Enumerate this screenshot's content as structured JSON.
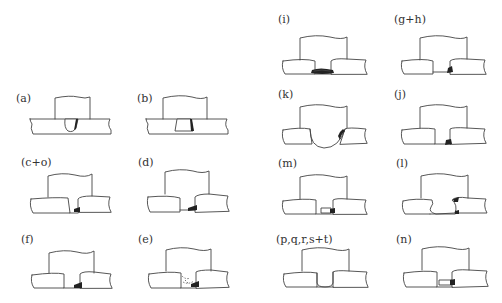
{
  "figure": {
    "panels": [
      {
        "id": "a",
        "label": "(a)"
      },
      {
        "id": "b",
        "label": "(b)"
      },
      {
        "id": "c_o",
        "label": "(c+o)"
      },
      {
        "id": "d",
        "label": "(d)"
      },
      {
        "id": "f",
        "label": "(f)"
      },
      {
        "id": "e",
        "label": "(e)"
      },
      {
        "id": "i",
        "label": "(i)"
      },
      {
        "id": "g_h",
        "label": "(g+h)"
      },
      {
        "id": "k",
        "label": "(k)"
      },
      {
        "id": "j",
        "label": "(j)"
      },
      {
        "id": "m",
        "label": "(m)"
      },
      {
        "id": "l",
        "label": "(l)"
      },
      {
        "id": "p_t",
        "label": "(p,q,r,s+t)"
      },
      {
        "id": "n",
        "label": "(n)"
      }
    ]
  }
}
